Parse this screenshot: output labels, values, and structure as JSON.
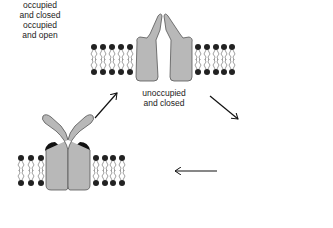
{
  "figure": {
    "type": "ion-channel-gating-cycle",
    "colors": {
      "protein_fill": "#b8b8b8",
      "protein_stroke": "#555555",
      "ligand": "#111111",
      "lipid_head": "#222222",
      "lipid_tail": "#777777",
      "arrow": "#111111",
      "background": "#ffffff"
    },
    "states": [
      {
        "id": "unoccupied-closed",
        "line1": "unoccupied",
        "line2": "and closed",
        "position": "top"
      },
      {
        "id": "occupied-open",
        "line1": "occupied",
        "line2": "and open",
        "position": "bottom-right"
      },
      {
        "id": "occupied-closed",
        "line1": "occupied",
        "line2": "and closed",
        "position": "bottom-left"
      }
    ],
    "transitions": [
      {
        "from": "unoccupied-closed",
        "to": "occupied-open",
        "direction": "down-right"
      },
      {
        "from": "occupied-open",
        "to": "occupied-closed",
        "direction": "left"
      },
      {
        "from": "occupied-closed",
        "to": "unoccupied-closed",
        "direction": "up-right"
      }
    ]
  }
}
